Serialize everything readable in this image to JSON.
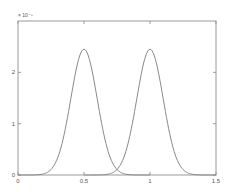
{
  "chart_data": {
    "type": "line",
    "title": "",
    "xlabel": "",
    "ylabel": "",
    "y_scale_label": "× 10⁻⁸",
    "y_multiplier_exponent": -8,
    "xlim": [
      0,
      1.5
    ],
    "ylim": [
      0,
      3.0
    ],
    "x_ticks": [
      0,
      0.5,
      1,
      1.5
    ],
    "x_tick_labels": [
      "0",
      "0.5",
      "1",
      "1.5"
    ],
    "y_ticks": [
      0,
      1,
      2
    ],
    "y_tick_labels": [
      "0",
      "1",
      "2"
    ],
    "grid": false,
    "legend": null,
    "series": [
      {
        "name": "curve 1",
        "shape": "gaussian",
        "mean": 0.5,
        "sigma": 0.1,
        "peak": 2.45,
        "x_range": [
          0,
          1.0
        ],
        "x": [
          0,
          0.1,
          0.2,
          0.3,
          0.35,
          0.4,
          0.45,
          0.5,
          0.55,
          0.6,
          0.65,
          0.7,
          0.8,
          0.9,
          1.0
        ],
        "values": [
          0.0,
          0.0008,
          0.027,
          0.33,
          0.8,
          1.49,
          2.16,
          2.45,
          2.16,
          1.49,
          0.8,
          0.33,
          0.027,
          0.0008,
          0.0
        ]
      },
      {
        "name": "curve 2",
        "shape": "gaussian",
        "mean": 1.0,
        "sigma": 0.1,
        "peak": 2.45,
        "x_range": [
          0.5,
          1.5
        ],
        "x": [
          0.5,
          0.6,
          0.7,
          0.8,
          0.85,
          0.9,
          0.95,
          1.0,
          1.05,
          1.1,
          1.15,
          1.2,
          1.3,
          1.4,
          1.5
        ],
        "values": [
          0.0,
          0.0008,
          0.027,
          0.33,
          0.8,
          1.49,
          2.16,
          2.45,
          2.16,
          1.49,
          0.8,
          0.33,
          0.027,
          0.0008,
          0.0
        ]
      }
    ]
  },
  "colors": {
    "axes": "#999999",
    "curve": "#8a8a8a",
    "text": "#555555"
  }
}
